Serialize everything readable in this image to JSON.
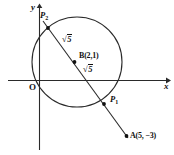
{
  "figure": {
    "background_color": "#ffffff",
    "stroke_color": "#222222",
    "width": 174,
    "height": 155
  },
  "axes": {
    "x_label": "x",
    "y_label": "y",
    "origin_label": "O",
    "x_axis": {
      "x1": 8,
      "y1": 80,
      "x2": 168,
      "y2": 80
    },
    "y_axis": {
      "x1": 39,
      "y1": 6,
      "x2": 39,
      "y2": 150
    }
  },
  "circle": {
    "center_px": {
      "x": 77,
      "y": 62
    },
    "radius_px": 45,
    "center_label": "B(2,1)",
    "center_dot_px": {
      "x": 74.5,
      "y": 62
    }
  },
  "line": {
    "from_px": {
      "x": 43,
      "y": 21
    },
    "to_px": {
      "x": 128,
      "y": 138
    }
  },
  "points": [
    {
      "name": "P2",
      "label": "P",
      "subscript": "2",
      "dot_px": {
        "x": 48,
        "y": 28
      }
    },
    {
      "name": "P1",
      "label": "P",
      "subscript": "1",
      "dot_px": {
        "x": 104,
        "y": 104
      }
    },
    {
      "name": "A",
      "label": "A(5, −3)",
      "dot_px": {
        "x": 126.5,
        "y": 136
      }
    }
  ],
  "radius_labels": [
    {
      "id": "upper",
      "symbol": "√",
      "value": "5",
      "text": "√5"
    },
    {
      "id": "lower",
      "symbol": "√",
      "value": "5",
      "text": "√5"
    }
  ]
}
